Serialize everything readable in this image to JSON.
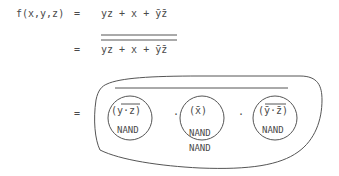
{
  "lines": [
    {
      "lhs": "f(x,y,z)",
      "eq": "=",
      "rhs": "yz + x + ȳz̄"
    },
    {
      "eq": "=",
      "rhs": "yz + x + ȳz̄",
      "overline": "double"
    },
    {
      "eq": "=",
      "overline": "single"
    }
  ],
  "terms": [
    {
      "expr": "(y·z)",
      "gate": "NAND",
      "overline": "y·z"
    },
    {
      "expr": "(x̄)",
      "gate": "NAND"
    },
    {
      "expr": "(ȳ·z̄)",
      "gate": "NAND",
      "overline": "ȳ·z̄"
    }
  ],
  "operators": {
    "dot1": "·",
    "dot2": "·"
  },
  "outer_gate": "NAND",
  "text": {
    "lhs": "f(x,y,z)",
    "eq1": "=",
    "eq2": "=",
    "eq3": "=",
    "rhs1": "yz + x + ȳz̄",
    "rhs2": "yz + x + ȳz̄",
    "t1": "(y·z)",
    "t2": "(x̄)",
    "t3": "(ȳ·z̄)",
    "g1": "NAND",
    "g2": "NAND",
    "g3": "NAND",
    "gout": "NAND",
    "dot": "·"
  }
}
